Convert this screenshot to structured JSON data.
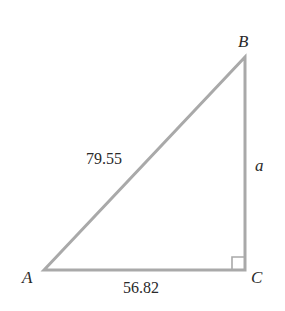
{
  "diagram": {
    "type": "right-triangle",
    "vertices": {
      "A": "A",
      "B": "B",
      "C": "C"
    },
    "right_angle_at": "C",
    "sides": {
      "hypotenuse_AB": "79.55",
      "leg_AC": "56.82",
      "leg_BC": "a"
    },
    "colors": {
      "stroke": "#a9a9a9",
      "text": "#2a2a2a"
    }
  }
}
